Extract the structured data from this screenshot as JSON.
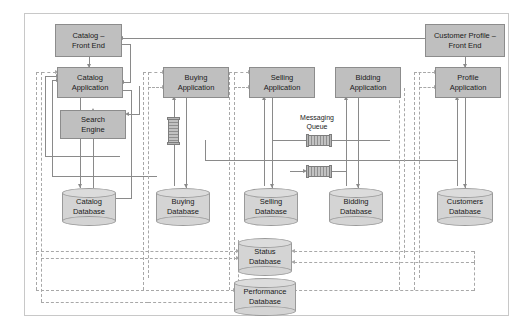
{
  "diagram": {
    "colors": {
      "box_fill": "#bfbfbf",
      "box_border": "#8c8c8c",
      "db_fill": "#d4d4d4",
      "db_border": "#9a9a9a",
      "solid_line": "#8a8a8a",
      "dashed_line": "#a8a8a8",
      "frame_border": "#c8c8c8",
      "background": "#ffffff"
    },
    "front_ends": [
      {
        "id": "catalog-front-end",
        "line1": "Catalog –",
        "line2": "Front End"
      },
      {
        "id": "customer-profile-front-end",
        "line1": "Customer Profile –",
        "line2": "Front End"
      }
    ],
    "applications": [
      {
        "id": "catalog-application",
        "line1": "Catalog",
        "line2": "Application"
      },
      {
        "id": "buying-application",
        "line1": "Buying",
        "line2": "Application"
      },
      {
        "id": "selling-application",
        "line1": "Selling",
        "line2": "Application"
      },
      {
        "id": "bidding-application",
        "line1": "Bidding",
        "line2": "Application"
      },
      {
        "id": "profile-application",
        "line1": "Profile",
        "line2": "Application"
      }
    ],
    "services": [
      {
        "id": "search-engine",
        "line1": "Search",
        "line2": "Engine"
      }
    ],
    "databases": [
      {
        "id": "catalog-database",
        "line1": "Catalog",
        "line2": "Database"
      },
      {
        "id": "buying-database",
        "line1": "Buying",
        "line2": "Database"
      },
      {
        "id": "selling-database",
        "line1": "Selling",
        "line2": "Database"
      },
      {
        "id": "bidding-database",
        "line1": "Bidding",
        "line2": "Database"
      },
      {
        "id": "customers-database",
        "line1": "Customers",
        "line2": "Database"
      },
      {
        "id": "status-database",
        "line1": "Status",
        "line2": "Database"
      },
      {
        "id": "performance-database",
        "line1": "Performance",
        "line2": "Database"
      }
    ],
    "annotations": [
      {
        "id": "messaging-queue",
        "line1": "Messaging",
        "line2": "Queue"
      }
    ],
    "queue_glyphs": [
      {
        "id": "queue-buying-vertical",
        "orientation": "vertical"
      },
      {
        "id": "queue-messaging-upper",
        "orientation": "horizontal"
      },
      {
        "id": "queue-messaging-lower",
        "orientation": "horizontal"
      }
    ]
  }
}
